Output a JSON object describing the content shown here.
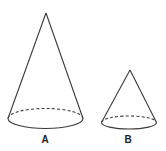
{
  "figure": {
    "stroke_color": "#3a3a3a",
    "background": "#ffffff",
    "cones": [
      {
        "label": "A",
        "apex": [
          46,
          13
        ],
        "base": {
          "cx": 45.5,
          "cy": 118.5,
          "rx": 37.5,
          "ry": 10
        },
        "label_pos": [
          45,
          143
        ]
      },
      {
        "label": "B",
        "apex": [
          130,
          70
        ],
        "base": {
          "cx": 129,
          "cy": 122.5,
          "rx": 27.5,
          "ry": 6.5
        },
        "label_pos": [
          128,
          143
        ]
      }
    ]
  }
}
